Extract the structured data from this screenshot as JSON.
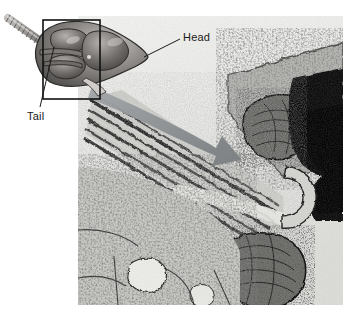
{
  "figure": {
    "type": "electron-micrograph-with-diagram",
    "canvas": {
      "width": 356,
      "height": 318,
      "background": "#ffffff"
    },
    "micrograph": {
      "name": "sperm-tail-electron-micrograph",
      "x": 78,
      "y": 16,
      "width": 265,
      "height": 289,
      "description": "Transmission electron micrograph of a sperm tail inside cytoplasm",
      "colors": {
        "background": "#e8e8e6",
        "cytoplasm": "#b9b9b6",
        "membrane_dark": "#2b2b2b",
        "dense_dark": "#111111",
        "light_lumen": "#e2e2de"
      }
    },
    "diagram": {
      "name": "sperm-head-and-tail-diagram",
      "description": "Three-dimensional rendered drawing of a sperm head with coiled tail",
      "colors": {
        "head_dark": "#4d4a48",
        "head_mid": "#8b8885",
        "head_light": "#b8b5b2",
        "tail_coil": "#9c9996",
        "outline": "#2a2a2a"
      },
      "callout_box": {
        "name": "region-of-interest-box",
        "x": 43,
        "y": 20,
        "width": 57,
        "height": 79,
        "stroke": "#111111",
        "stroke_width": 1.5
      }
    },
    "arrow": {
      "name": "magnification-arrow",
      "description": "Large curved gray arrow from the diagram into the micrograph",
      "color": "#8f9295"
    },
    "labels": [
      {
        "id": "head",
        "text": "Head",
        "x": 183,
        "y": 31,
        "leader": {
          "from_x": 181,
          "from_y": 38,
          "to_x": 145,
          "to_y": 57
        }
      },
      {
        "id": "tail",
        "text": "Tail",
        "x": 27,
        "y": 110,
        "leader": {
          "from_x": 40,
          "from_y": 108,
          "to_x": 54,
          "to_y": 47
        }
      }
    ]
  }
}
